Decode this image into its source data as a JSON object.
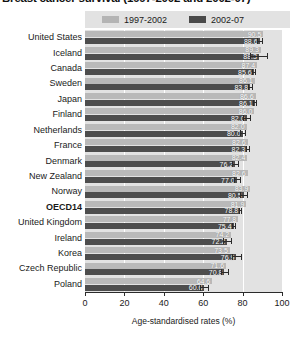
{
  "chart_data": {
    "type": "bar",
    "orientation": "horizontal",
    "title": "Breast cancer survival (1997-2002 and 2002-07)",
    "xlabel": "Age-standardised rates (%)",
    "ylabel": "",
    "xlim": [
      0,
      100
    ],
    "xticks": [
      0,
      20,
      40,
      60,
      80,
      100
    ],
    "xticklabels": [
      "0",
      "20",
      "40",
      "60",
      "80",
      "100"
    ],
    "grid": true,
    "grid_axis": "x",
    "legend_position": "top",
    "colors": {
      "series_1997_2002": "#b9b9b9",
      "series_2002_07": "#4d4d4d",
      "plot_background": "#e2e2e2",
      "gridline": "#ffffff",
      "error_bar": "#2b2b2b"
    },
    "categories": [
      "United States",
      "Iceland",
      "Canada",
      "Sweden",
      "Japan",
      "Finland",
      "Netherlands",
      "France",
      "Denmark",
      "New Zealand",
      "Norway",
      "OECD14",
      "United Kingdom",
      "Ireland",
      "Korea",
      "Czech Republic",
      "Poland"
    ],
    "highlight_category": "OECD14",
    "series": [
      {
        "name": "1997-2002",
        "color": "#b9b9b9",
        "values": [
          90.5,
          89.3,
          87.4,
          86.1,
          86.6,
          86.0,
          82.0,
          82.6,
          82.4,
          82.6,
          83.9,
          81.9,
          77.8,
          74.2,
          73.5,
          71.6,
          64.6
        ],
        "labels": [
          "90.5",
          "89.3",
          "87.4",
          "86.1",
          "86.6",
          "86.0",
          "82.0",
          "82.6",
          "82.4",
          "82.6",
          "83.9",
          "81.9",
          "77.8",
          "74.2",
          "73.5",
          "71.6",
          "64.6"
        ]
      },
      {
        "name": "2002-07",
        "color": "#4d4d4d",
        "values": [
          88.6,
          88.3,
          85.6,
          83.8,
          86.1,
          82.0,
          80.0,
          82.3,
          76.2,
          77.0,
          80.5,
          78.8,
          75.4,
          72.2,
          76.9,
          70.8,
          60.6
        ],
        "labels": [
          "88.6",
          "88.3",
          "85.6",
          "83.8",
          "86.1",
          "82.0",
          "80.0",
          "82.3",
          "76.2",
          "77.0",
          "80.5",
          "78.8",
          "75.4",
          "72.2",
          "76.9",
          "70.8",
          "60.6"
        ],
        "error_low": [
          87.4,
          84.0,
          85.0,
          82.6,
          85.4,
          80.4,
          78.8,
          81.6,
          74.6,
          75.4,
          78.6,
          78.2,
          74.8,
          70.2,
          74.8,
          69.2,
          58.6
        ],
        "error_high": [
          89.8,
          92.6,
          86.2,
          85.0,
          86.8,
          83.6,
          81.2,
          83.0,
          77.8,
          78.6,
          82.4,
          79.4,
          76.0,
          74.2,
          79.0,
          72.4,
          62.6
        ]
      }
    ]
  },
  "legend": {
    "items": [
      {
        "label": "1997-2002",
        "swatch_class": "sw-light"
      },
      {
        "label": "2002-07",
        "swatch_class": "sw-dark"
      }
    ]
  }
}
